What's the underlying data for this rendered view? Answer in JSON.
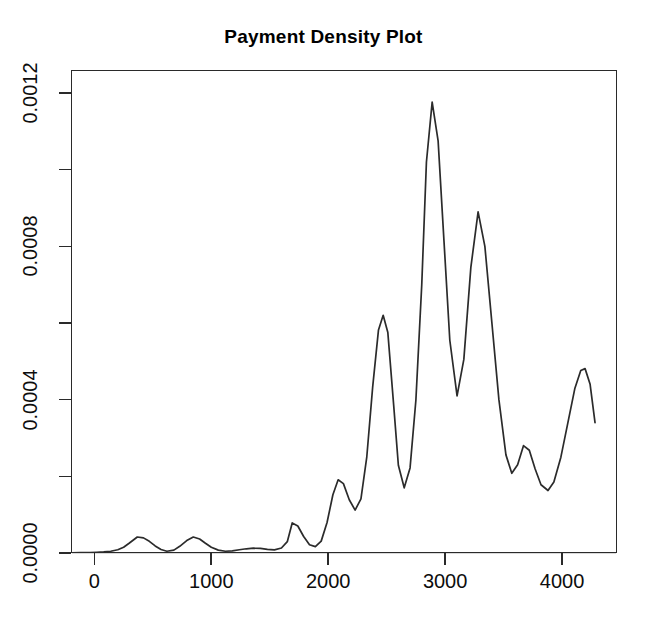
{
  "chart_data": {
    "type": "line",
    "title": "Payment Density Plot",
    "xlabel": "",
    "ylabel": "",
    "grid": false,
    "legend": null,
    "xlim": [
      -200,
      4470
    ],
    "ylim": [
      0.0,
      0.00126
    ],
    "x_ticks": [
      0,
      1000,
      2000,
      3000,
      4000
    ],
    "x_tick_labels": [
      "0",
      "1000",
      "2000",
      "3000",
      "4000"
    ],
    "y_ticks": [
      0.0,
      0.0004,
      0.0008,
      0.0012
    ],
    "y_tick_labels": [
      "0.0000",
      "0.0004",
      "0.0008",
      "0.0012"
    ],
    "y_minor_ticks": [
      0.0002,
      0.0006,
      0.001
    ],
    "series": [
      {
        "name": "payment density",
        "x": [
          -196,
          -120,
          -40,
          20,
          80,
          140,
          200,
          250,
          300,
          367,
          420,
          470,
          520,
          570,
          620,
          680,
          730,
          790,
          846,
          900,
          950,
          1000,
          1060,
          1120,
          1180,
          1240,
          1300,
          1360,
          1420,
          1480,
          1540,
          1600,
          1650,
          1692,
          1740,
          1790,
          1840,
          1890,
          1940,
          1990,
          2040,
          2085,
          2130,
          2180,
          2230,
          2280,
          2330,
          2380,
          2430,
          2470,
          2510,
          2560,
          2600,
          2650,
          2700,
          2750,
          2800,
          2840,
          2889,
          2940,
          2990,
          3040,
          3102,
          3160,
          3220,
          3282,
          3340,
          3400,
          3460,
          3520,
          3570,
          3620,
          3670,
          3720,
          3770,
          3820,
          3880,
          3930,
          3990,
          4050,
          4110,
          4160,
          4197,
          4240,
          4282
        ],
        "y": [
          5e-07,
          8e-07,
          1.2e-06,
          1.8e-06,
          2.8e-06,
          4.5e-06,
          8.5e-06,
          1.5e-05,
          2.6e-05,
          4.18e-05,
          3.95e-05,
          3.05e-05,
          1.85e-05,
          9e-06,
          4.5e-06,
          7.5e-06,
          1.75e-05,
          3.25e-05,
          4.18e-05,
          3.65e-05,
          2.55e-05,
          1.5e-05,
          7.5e-06,
          4.5e-06,
          5.5e-06,
          8.5e-06,
          1.1e-05,
          1.25e-05,
          1.2e-05,
          9.5e-06,
          8e-06,
          1.3e-05,
          2.95e-05,
          7.85e-05,
          7.05e-05,
          4.3e-05,
          2.15e-05,
          1.65e-05,
          3.1e-05,
          7.95e-05,
          0.000152,
          0.000191,
          0.000181,
          0.000139,
          0.000112,
          0.000141,
          0.000251,
          0.000432,
          0.000582,
          0.00062,
          0.000575,
          0.000385,
          0.000229,
          0.00017,
          0.000222,
          0.000399,
          0.0007,
          0.00102,
          0.001176,
          0.001075,
          0.000815,
          0.000555,
          0.00041,
          0.000505,
          0.000745,
          0.00089,
          0.0008,
          0.0006,
          0.0004,
          0.000256,
          0.000208,
          0.00023,
          0.00028,
          0.000268,
          0.000219,
          0.000178,
          0.000163,
          0.000185,
          0.00025,
          0.00034,
          0.00043,
          0.000476,
          0.000481,
          0.00044,
          0.00034
        ]
      }
    ],
    "baseline_reference": 0.0
  }
}
